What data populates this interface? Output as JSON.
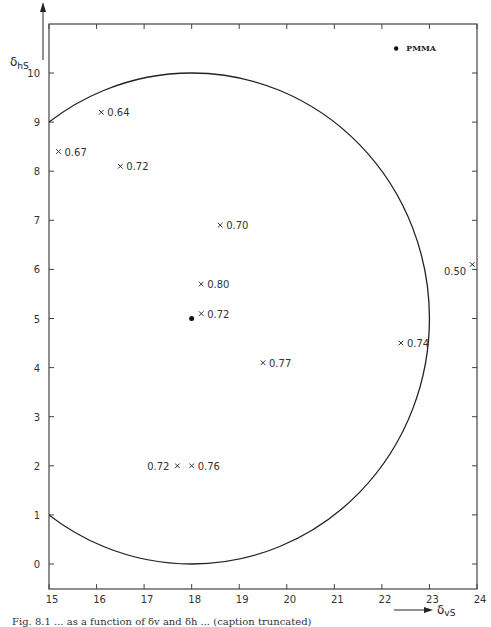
{
  "chart_data": {
    "type": "scatter",
    "title": "",
    "xlabel": "δvS",
    "ylabel": "δhS",
    "xlim": [
      15,
      24
    ],
    "ylim": [
      -0.6,
      10.8
    ],
    "x_ticks": [
      15,
      16,
      17,
      18,
      19,
      20,
      21,
      22,
      23,
      24
    ],
    "y_ticks": [
      0,
      1,
      2,
      3,
      4,
      5,
      6,
      7,
      8,
      9,
      10
    ],
    "grid": false,
    "legend": null,
    "circle": {
      "center": [
        18,
        5
      ],
      "radius": 5,
      "description": "solubility circle"
    },
    "center_point": {
      "x": 18,
      "y": 5,
      "marker": "dot"
    },
    "reference_point": {
      "label": "PMMA",
      "x": 22.3,
      "y": 10.5,
      "marker": "dot"
    },
    "points": [
      {
        "x": 16.1,
        "y": 9.2,
        "label": "0.64",
        "label_side": "right"
      },
      {
        "x": 15.2,
        "y": 8.4,
        "label": "0.67",
        "label_side": "right"
      },
      {
        "x": 16.5,
        "y": 8.1,
        "label": "0.72",
        "label_side": "right"
      },
      {
        "x": 18.6,
        "y": 6.9,
        "label": "0.70",
        "label_side": "right"
      },
      {
        "x": 18.2,
        "y": 5.7,
        "label": "0.80",
        "label_side": "right"
      },
      {
        "x": 18.2,
        "y": 5.1,
        "label": "0.72",
        "label_side": "right"
      },
      {
        "x": 19.5,
        "y": 4.1,
        "label": "0.77",
        "label_side": "right"
      },
      {
        "x": 22.4,
        "y": 4.5,
        "label": "0.74",
        "label_side": "right"
      },
      {
        "x": 23.9,
        "y": 6.1,
        "label": "0.50",
        "label_side": "left-below"
      },
      {
        "x": 17.7,
        "y": 2.0,
        "label": "0.72",
        "label_side": "left"
      },
      {
        "x": 18.0,
        "y": 2.0,
        "label": "0.76",
        "label_side": "right"
      }
    ]
  },
  "labels": {
    "y_axis_main": "δ",
    "y_axis_sub": "hS",
    "x_axis_main": "δ",
    "x_axis_sub": "vS",
    "pmma": "PMMA",
    "caption": "Fig. 8.1 ... as a function of δv and δh ... (caption truncated)"
  }
}
